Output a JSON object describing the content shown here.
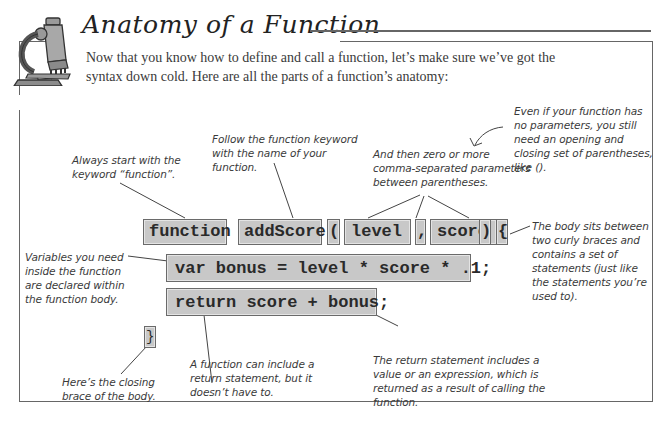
{
  "header": {
    "title": "Anatomy of a Function",
    "icon": "microscope-icon",
    "intro": "Now that you know how to define and call a function, let’s make sure we’ve got the syntax down cold. Here are all the parts of a function’s anatomy:"
  },
  "code": {
    "keyword": "function",
    "name": "addScore",
    "open_paren": "(",
    "param1": "level",
    "comma": ",",
    "param2": "score",
    "close_paren": ")",
    "open_brace": "{",
    "line1": "var bonus = level * score * .1;",
    "line2": "return score + bonus;",
    "close_brace": "}"
  },
  "annotations": {
    "keyword": "Always start with the keyword “function”.",
    "name": "Follow the function keyword with the name of your function.",
    "params": "And then zero or more comma-separated parameters between parentheses.",
    "no_params": "Even if your function has no parameters, you still need an opening and closing set of parentheses, like ().",
    "body": "The body sits between two curly braces and contains a set of statements (just like the statements you’re used to).",
    "variables": "Variables you need inside the function are declared within the function body.",
    "closing_brace": "Here’s the closing brace of the body.",
    "optional_return": "A function can include a return statement, but it doesn’t have to.",
    "return_statement": "The return statement includes a value or an expression, which is returned as a result of calling the function."
  }
}
